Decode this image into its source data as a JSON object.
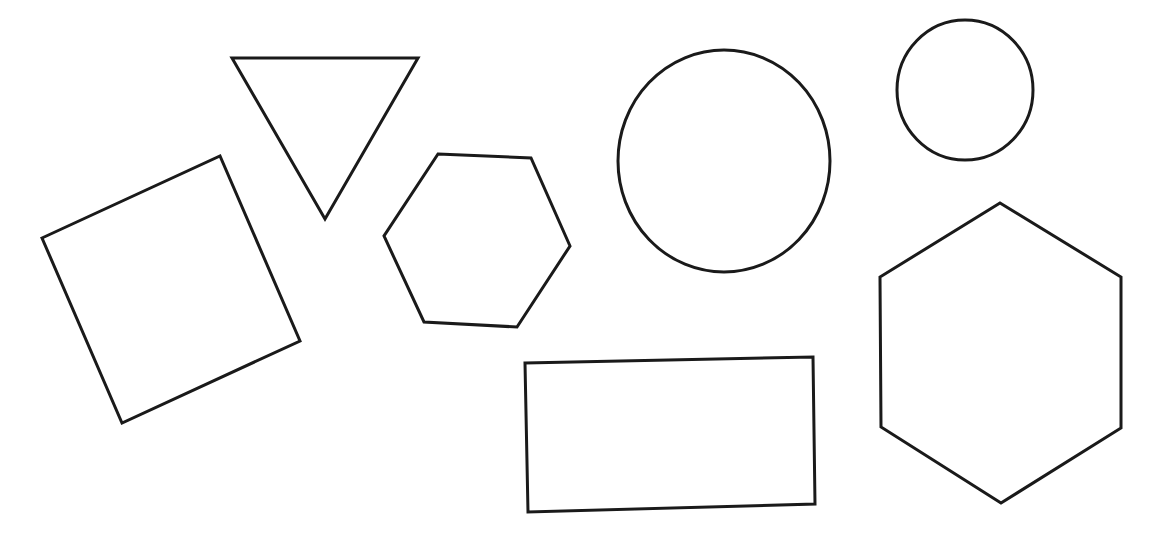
{
  "canvas": {
    "width": 1155,
    "height": 555,
    "background": "#ffffff"
  },
  "style": {
    "stroke": "#1a1a1a",
    "stroke_width": 3
  },
  "shapes": [
    {
      "id": "square",
      "type": "polygon",
      "label": "rotated square",
      "points": "42,238 220,156 300,341 122,423"
    },
    {
      "id": "triangle",
      "type": "polygon",
      "label": "inverted triangle",
      "points": "232,58 418,58 325,219"
    },
    {
      "id": "hexagon-small",
      "type": "polygon",
      "label": "small hexagon",
      "points": "438,154 531,158 570,246 517,327 424,322 384,236"
    },
    {
      "id": "circle-large",
      "type": "ellipse",
      "label": "large circle",
      "cx": 724,
      "cy": 161,
      "rx": 106,
      "ry": 111
    },
    {
      "id": "circle-small",
      "type": "ellipse",
      "label": "small circle",
      "cx": 965,
      "cy": 90,
      "rx": 68,
      "ry": 70
    },
    {
      "id": "hexagon-large",
      "type": "polygon",
      "label": "large hexagon",
      "points": "1000,203 1121,277 1121,428 1001,503 881,427 880,277"
    },
    {
      "id": "rectangle",
      "type": "polygon",
      "label": "rectangle",
      "points": "525,363 813,357 815,504 528,512"
    }
  ]
}
